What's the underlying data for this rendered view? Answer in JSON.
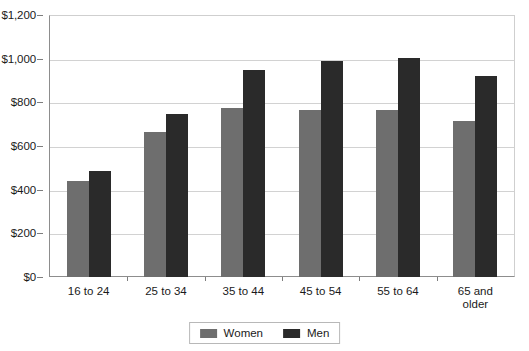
{
  "chart_data": {
    "type": "bar",
    "title": "",
    "subtitle": "",
    "xlabel": "",
    "ylabel": "",
    "categories": [
      "16 to 24",
      "25 to 34",
      "35 to 44",
      "45 to 54",
      "55 to 64",
      "65 and\nolder"
    ],
    "series": [
      {
        "name": "Women",
        "color": "#6e6e6e",
        "values": [
          440,
          665,
          775,
          763,
          763,
          715
        ]
      },
      {
        "name": "Men",
        "color": "#2a2a2a",
        "values": [
          485,
          747,
          950,
          988,
          1005,
          920
        ]
      }
    ],
    "ylim": [
      0,
      1200
    ],
    "ytick_step": 200,
    "ytick_labels": [
      "$0",
      "$200",
      "$400",
      "$600",
      "$800",
      "$1,000",
      "$1,200"
    ],
    "ytick_values": [
      0,
      200,
      400,
      600,
      800,
      1000,
      1200
    ],
    "grid": true,
    "grid_axis": "y",
    "legend_position": "bottom",
    "legend_entries": [
      "Women",
      "Men"
    ],
    "annotations": []
  },
  "colors": {
    "women_bar": "#6e6e6e",
    "men_bar": "#2a2a2a",
    "gridline": "#d2d2d2",
    "axis": "#8d8d8d",
    "plot_border": "#cfcfcf",
    "background": "#ffffff",
    "text": "#1a1a1a"
  }
}
